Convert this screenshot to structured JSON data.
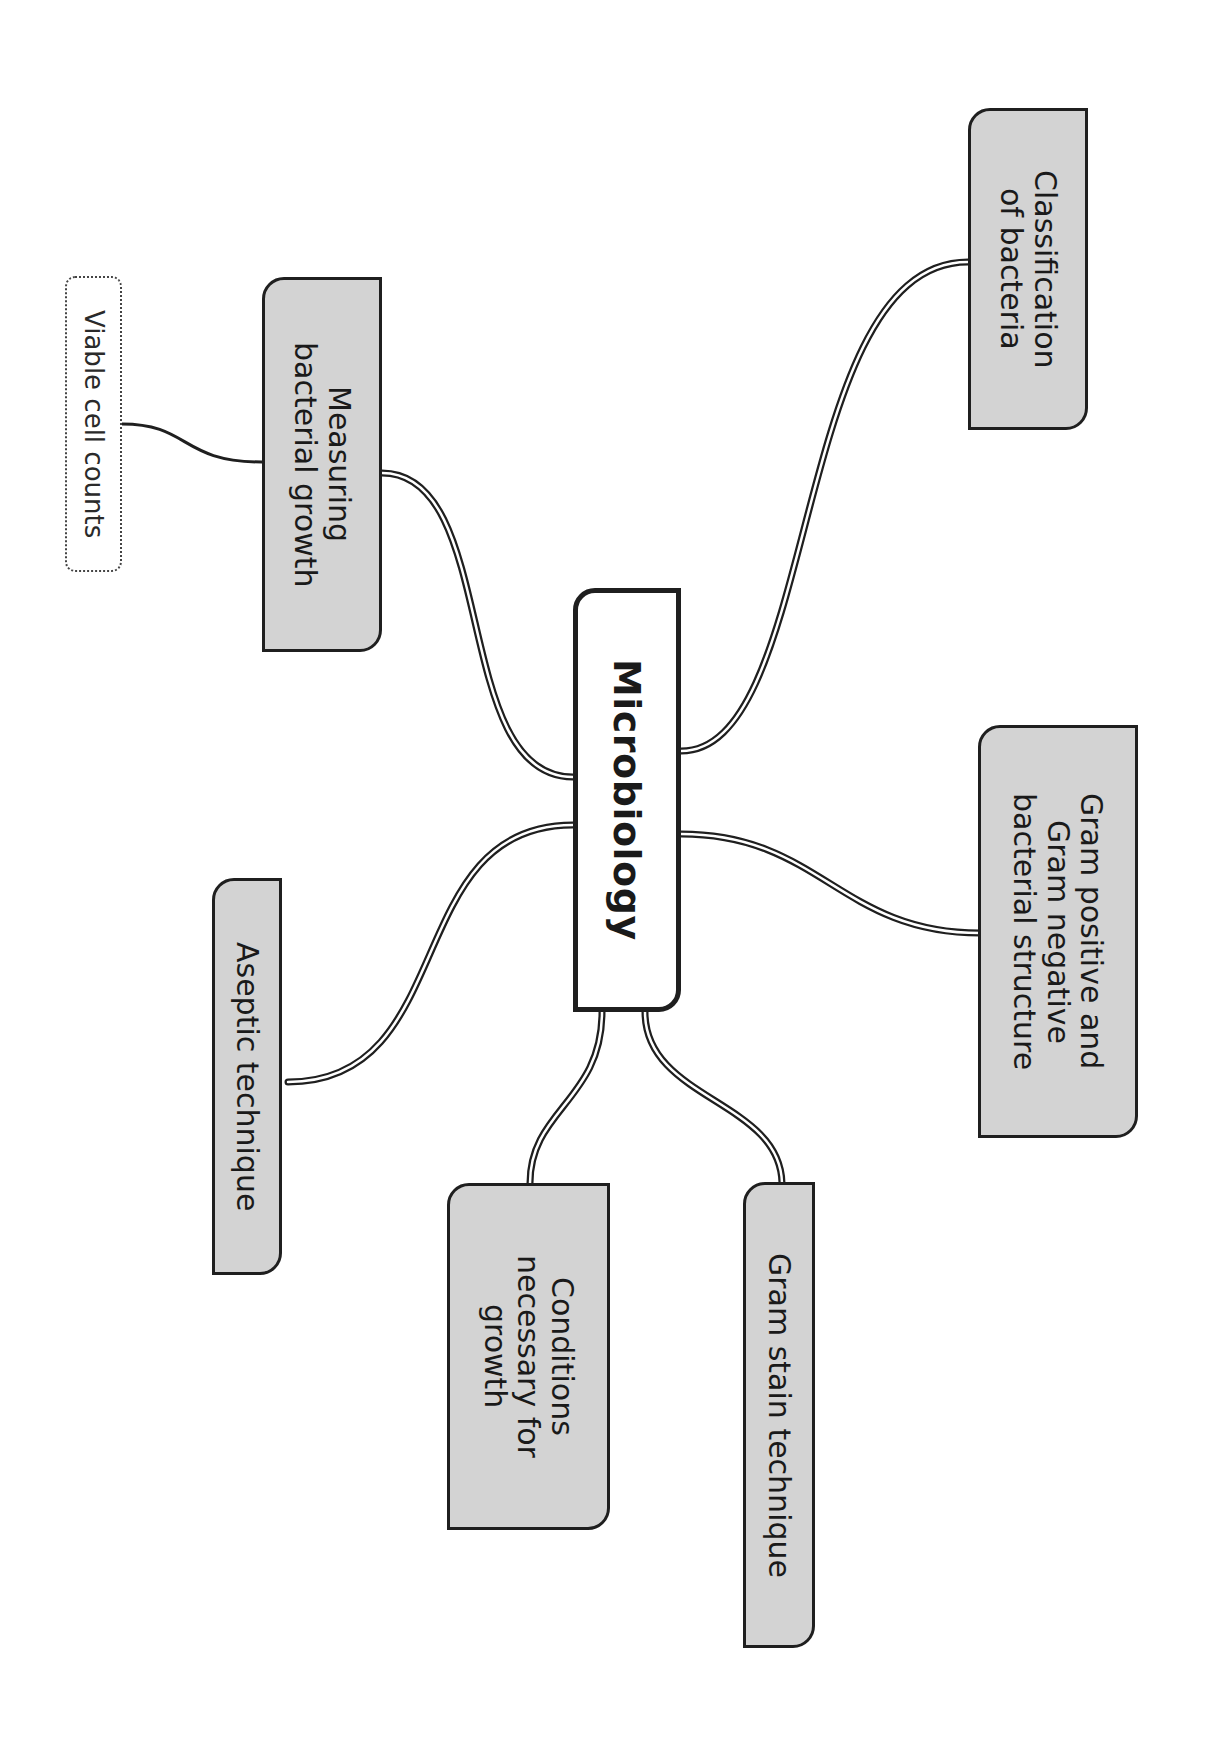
{
  "diagram": {
    "type": "mind-map",
    "orientation": "rotated-90-clockwise",
    "colors": {
      "topic_fill": "#d3d3d3",
      "central_fill": "#ffffff",
      "border": "#1f1f1f",
      "background": "#ffffff"
    },
    "central": {
      "label": "Microbiology"
    },
    "topics": [
      {
        "id": "classification",
        "label": "Classification\nof bacteria"
      },
      {
        "id": "gram-structure",
        "label": "Gram positive and\nGram negative\nbacterial structure"
      },
      {
        "id": "gram-stain",
        "label": "Gram stain technique"
      },
      {
        "id": "conditions",
        "label": "Conditions\nnecessary for\ngrowth"
      },
      {
        "id": "aseptic",
        "label": "Aseptic technique"
      },
      {
        "id": "measuring",
        "label": "Measuring\nbacterial growth"
      }
    ],
    "subtopics": [
      {
        "id": "viable-cell-counts",
        "parent": "measuring",
        "label": "Viable cell counts"
      }
    ]
  }
}
